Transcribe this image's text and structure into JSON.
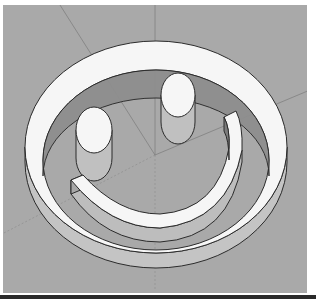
{
  "scene": {
    "subject": "3D smiley face model",
    "background_color": "#a9a9a9",
    "top_face_color": "#f6f6f6",
    "side_color_light": "#c8c8c8",
    "side_color_dark": "#8a8a8a",
    "edge_color": "#2b2b2b",
    "axis_color": "#7e7e7e"
  },
  "parts": {
    "ring": "outer ring",
    "left_eye": "left eye",
    "right_eye": "right eye",
    "mouth": "mouth arc"
  }
}
